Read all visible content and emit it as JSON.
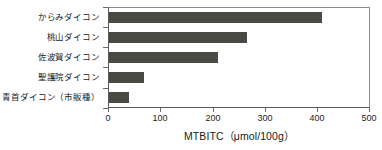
{
  "chart_data": {
    "type": "bar",
    "orientation": "horizontal",
    "title": "",
    "xlabel": "MTBITC（μmol/100g）",
    "ylabel": "",
    "xlim": [
      0,
      500
    ],
    "xticks": [
      0,
      100,
      200,
      300,
      400,
      500
    ],
    "grid": false,
    "legend": null,
    "categories": [
      "からみダイコン",
      "桃山ダイコン",
      "佐波賀ダイコン",
      "聖護院ダイコン",
      "青首ダイコン（市販種）"
    ],
    "values": [
      410,
      265,
      210,
      67,
      38
    ],
    "series": [
      {
        "name": "MTBITC",
        "values": [
          410,
          265,
          210,
          67,
          38
        ],
        "color": "#4a4a45"
      }
    ]
  },
  "axis": {
    "x_title": "MTBITC（μmol/100g）",
    "tick_labels": [
      "0",
      "100",
      "200",
      "300",
      "400",
      "500"
    ]
  },
  "colors": {
    "bar": "#4a4a45",
    "frame": "#8d8d8d",
    "axis": "#5a5a5a",
    "text": "#1a1a1a",
    "background": "#ffffff"
  }
}
